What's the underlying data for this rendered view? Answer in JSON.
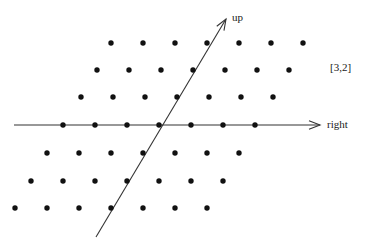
{
  "figure": {
    "title": "",
    "background_color": "#ffffff",
    "width": 379,
    "height": 241
  },
  "labels": {
    "up": "up",
    "right": "right",
    "vector": "[3,2]"
  },
  "colors": {
    "dot": "#111111",
    "axis": "#333333",
    "text": "#1a1a1a"
  },
  "chart_data": {
    "type": "scatter",
    "title": "",
    "xlabel": "right",
    "ylabel": "up",
    "grid": false,
    "legend": null,
    "annotations": [
      {
        "text": "up",
        "x": 232,
        "y": 16
      },
      {
        "text": "right",
        "x": 327,
        "y": 125
      },
      {
        "text": "[3,2]",
        "x": 330,
        "y": 68
      }
    ],
    "lattice": {
      "description": "triangular lattice, 7 rows by 7 columns",
      "rows": 7,
      "columns": 7,
      "x_spacing": 32,
      "y_spacing": 27.3,
      "row_shift": 16,
      "origin": {
        "x": 159,
        "y": 125
      }
    },
    "points": [
      {
        "x": 111,
        "y": 43
      },
      {
        "x": 143,
        "y": 43
      },
      {
        "x": 175,
        "y": 43
      },
      {
        "x": 207,
        "y": 43
      },
      {
        "x": 239,
        "y": 43
      },
      {
        "x": 271,
        "y": 43
      },
      {
        "x": 303,
        "y": 43
      },
      {
        "x": 97,
        "y": 70
      },
      {
        "x": 129,
        "y": 70
      },
      {
        "x": 161,
        "y": 70
      },
      {
        "x": 193,
        "y": 70
      },
      {
        "x": 225,
        "y": 70
      },
      {
        "x": 257,
        "y": 70
      },
      {
        "x": 289,
        "y": 70
      },
      {
        "x": 81,
        "y": 97
      },
      {
        "x": 113,
        "y": 97
      },
      {
        "x": 145,
        "y": 97
      },
      {
        "x": 177,
        "y": 97
      },
      {
        "x": 209,
        "y": 97
      },
      {
        "x": 241,
        "y": 97
      },
      {
        "x": 273,
        "y": 97
      },
      {
        "x": 63,
        "y": 125
      },
      {
        "x": 95,
        "y": 125
      },
      {
        "x": 127,
        "y": 125
      },
      {
        "x": 159,
        "y": 125
      },
      {
        "x": 191,
        "y": 125
      },
      {
        "x": 223,
        "y": 125
      },
      {
        "x": 255,
        "y": 125
      },
      {
        "x": 47,
        "y": 153
      },
      {
        "x": 79,
        "y": 153
      },
      {
        "x": 111,
        "y": 153
      },
      {
        "x": 143,
        "y": 153
      },
      {
        "x": 175,
        "y": 153
      },
      {
        "x": 207,
        "y": 153
      },
      {
        "x": 239,
        "y": 153
      },
      {
        "x": 31,
        "y": 181
      },
      {
        "x": 63,
        "y": 181
      },
      {
        "x": 95,
        "y": 181
      },
      {
        "x": 127,
        "y": 181
      },
      {
        "x": 159,
        "y": 181
      },
      {
        "x": 191,
        "y": 181
      },
      {
        "x": 223,
        "y": 181
      },
      {
        "x": 15,
        "y": 208
      },
      {
        "x": 47,
        "y": 208
      },
      {
        "x": 79,
        "y": 208
      },
      {
        "x": 111,
        "y": 208
      },
      {
        "x": 143,
        "y": 208
      },
      {
        "x": 175,
        "y": 208
      },
      {
        "x": 207,
        "y": 208
      }
    ],
    "axes": [
      {
        "name": "right",
        "x1": 14,
        "y1": 125,
        "x2": 320,
        "y2": 125,
        "arrow": "end"
      },
      {
        "name": "up",
        "x1": 96,
        "y1": 237,
        "x2": 226,
        "y2": 19,
        "arrow": "end"
      }
    ]
  }
}
